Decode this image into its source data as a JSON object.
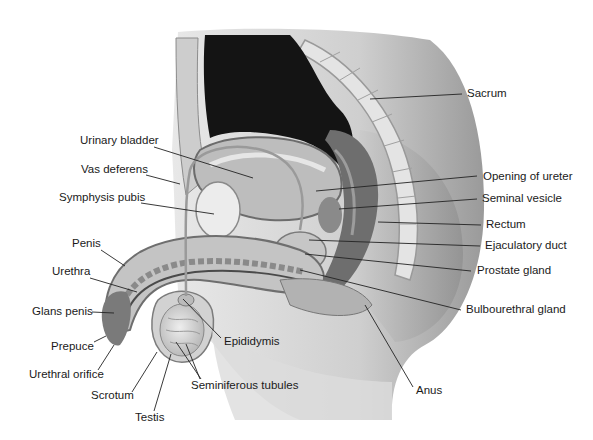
{
  "colors": {
    "background": "#ffffff",
    "label_text": "#1a1a1a",
    "leader_line": "#222222",
    "bladder_cavity": "#141414",
    "tissue_light": "#d9d9d9",
    "tissue_mid": "#a6a6a6",
    "tissue_dark": "#5a5a5a"
  },
  "labels": {
    "left": [
      {
        "id": "urinary-bladder",
        "text": "Urinary bladder",
        "x": 80,
        "y": 140
      },
      {
        "id": "vas-deferens",
        "text": "Vas deferens",
        "x": 81,
        "y": 169
      },
      {
        "id": "symphysis-pubis",
        "text": "Symphysis pubis",
        "x": 59,
        "y": 197
      },
      {
        "id": "penis",
        "text": "Penis",
        "x": 72,
        "y": 243
      },
      {
        "id": "urethra",
        "text": "Urethra",
        "x": 52,
        "y": 271
      },
      {
        "id": "glans-penis",
        "text": "Glans penis",
        "x": 32,
        "y": 306
      },
      {
        "id": "prepuce",
        "text": "Prepuce",
        "x": 51,
        "y": 341
      },
      {
        "id": "urethral-orifice",
        "text": "Urethral orifice",
        "x": 29,
        "y": 369
      },
      {
        "id": "scrotum",
        "text": "Scrotum",
        "x": 91,
        "y": 391
      },
      {
        "id": "testis",
        "text": "Testis",
        "x": 135,
        "y": 411
      }
    ],
    "center": [
      {
        "id": "epididymis",
        "text": "Epididymis",
        "x": 224,
        "y": 336
      },
      {
        "id": "seminiferous-tubules",
        "text": "Seminiferous tubules",
        "x": 191,
        "y": 380
      }
    ],
    "right": [
      {
        "id": "sacrum",
        "text": "Sacrum",
        "x": 467,
        "y": 88
      },
      {
        "id": "opening-of-ureter",
        "text": "Opening of ureter",
        "x": 483,
        "y": 171
      },
      {
        "id": "seminal-vesicle",
        "text": "Seminal vesicle",
        "x": 482,
        "y": 193
      },
      {
        "id": "rectum",
        "text": "Rectum",
        "x": 486,
        "y": 219
      },
      {
        "id": "ejaculatory-duct",
        "text": "Ejaculatory duct",
        "x": 485,
        "y": 240
      },
      {
        "id": "prostate-gland",
        "text": "Prostate gland",
        "x": 477,
        "y": 265
      },
      {
        "id": "bulbourethral-gland",
        "text": "Bulbourethral gland",
        "x": 466,
        "y": 304
      },
      {
        "id": "anus",
        "text": "Anus",
        "x": 416,
        "y": 385
      }
    ]
  },
  "leaders": [
    {
      "id": "urinary-bladder",
      "x1": 154,
      "y1": 147,
      "x2": 253,
      "y2": 178
    },
    {
      "id": "vas-deferens",
      "x1": 146,
      "y1": 175,
      "x2": 180,
      "y2": 184
    },
    {
      "id": "symphysis-pubis",
      "x1": 141,
      "y1": 203,
      "x2": 214,
      "y2": 214
    },
    {
      "id": "penis",
      "x1": 101,
      "y1": 250,
      "x2": 125,
      "y2": 266
    },
    {
      "id": "urethra",
      "x1": 90,
      "y1": 278,
      "x2": 137,
      "y2": 292
    },
    {
      "id": "glans-penis",
      "x1": 92,
      "y1": 312,
      "x2": 114,
      "y2": 313
    },
    {
      "id": "prepuce",
      "x1": 94,
      "y1": 342,
      "x2": 106,
      "y2": 336
    },
    {
      "id": "urethral-orifice",
      "x1": 98,
      "y1": 370,
      "x2": 114,
      "y2": 345
    },
    {
      "id": "scrotum",
      "x1": 132,
      "y1": 392,
      "x2": 157,
      "y2": 352
    },
    {
      "id": "testis",
      "x1": 154,
      "y1": 411,
      "x2": 171,
      "y2": 354
    },
    {
      "id": "epididymis",
      "x1": 221,
      "y1": 338,
      "x2": 183,
      "y2": 299
    },
    {
      "id": "seminiferous-tubules-a",
      "x1": 201,
      "y1": 379,
      "x2": 176,
      "y2": 342
    },
    {
      "id": "seminiferous-tubules-b",
      "x1": 200,
      "y1": 379,
      "x2": 186,
      "y2": 344
    },
    {
      "id": "sacrum",
      "x1": 462,
      "y1": 94,
      "x2": 370,
      "y2": 99
    },
    {
      "id": "opening-of-ureter",
      "x1": 477,
      "y1": 176,
      "x2": 316,
      "y2": 191
    },
    {
      "id": "seminal-vesicle",
      "x1": 477,
      "y1": 199,
      "x2": 339,
      "y2": 209
    },
    {
      "id": "rectum",
      "x1": 481,
      "y1": 225,
      "x2": 378,
      "y2": 222
    },
    {
      "id": "ejaculatory-duct",
      "x1": 480,
      "y1": 246,
      "x2": 309,
      "y2": 240
    },
    {
      "id": "prostate-gland",
      "x1": 471,
      "y1": 271,
      "x2": 305,
      "y2": 254
    },
    {
      "id": "bulbourethral-gland",
      "x1": 461,
      "y1": 310,
      "x2": 300,
      "y2": 270
    },
    {
      "id": "anus",
      "x1": 413,
      "y1": 387,
      "x2": 365,
      "y2": 305
    }
  ]
}
